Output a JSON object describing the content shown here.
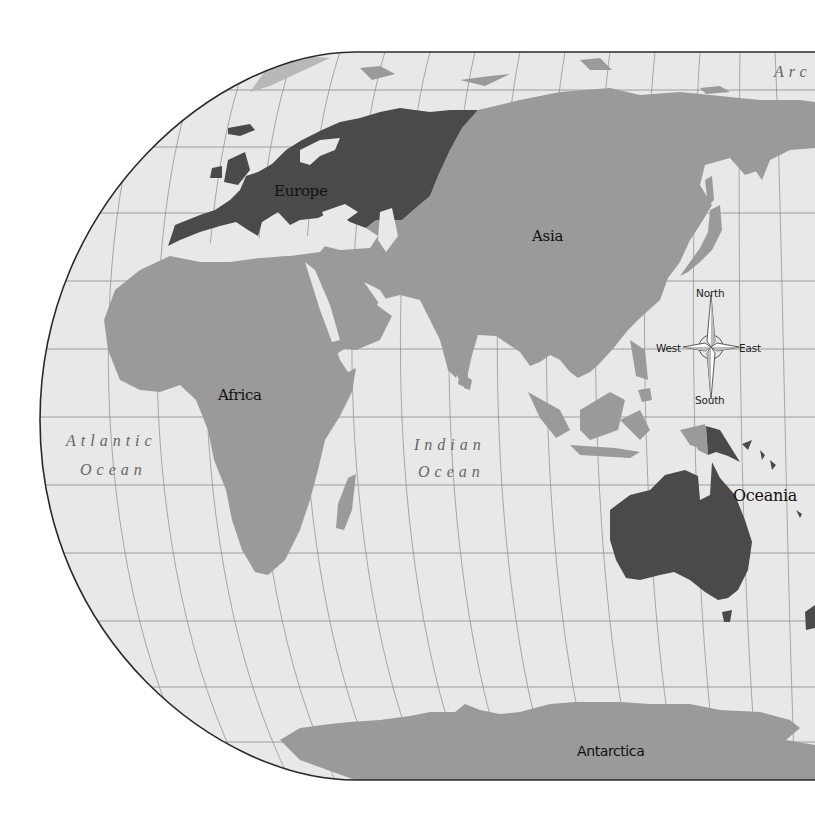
{
  "map": {
    "projection": "Robinson (Eastern Hemisphere crop)",
    "colors": {
      "ocean": "#e8e8e8",
      "graticule": "#7a7a7a",
      "border": "#2a2a2a",
      "land_light": "#9a9a9a",
      "land_dark": "#4a4a4a",
      "label_dark": "#111111",
      "ocean_label": "#666666"
    },
    "continents": [
      {
        "id": "europe",
        "label": "Europe",
        "shade": "dark"
      },
      {
        "id": "asia",
        "label": "Asia",
        "shade": "light"
      },
      {
        "id": "africa",
        "label": "Africa",
        "shade": "light"
      },
      {
        "id": "oceania",
        "label": "Oceania",
        "shade": "dark"
      },
      {
        "id": "antarctica",
        "label": "Antarctica",
        "shade": "light"
      }
    ],
    "oceans": [
      {
        "id": "atlantic",
        "line1": "Atlantic",
        "line2": "Ocean"
      },
      {
        "id": "indian",
        "line1": "Indian",
        "line2": "Ocean"
      },
      {
        "id": "arctic",
        "line1": "Arc"
      }
    ],
    "compass": {
      "north": "North",
      "south": "South",
      "east": "East",
      "west": "West"
    }
  }
}
